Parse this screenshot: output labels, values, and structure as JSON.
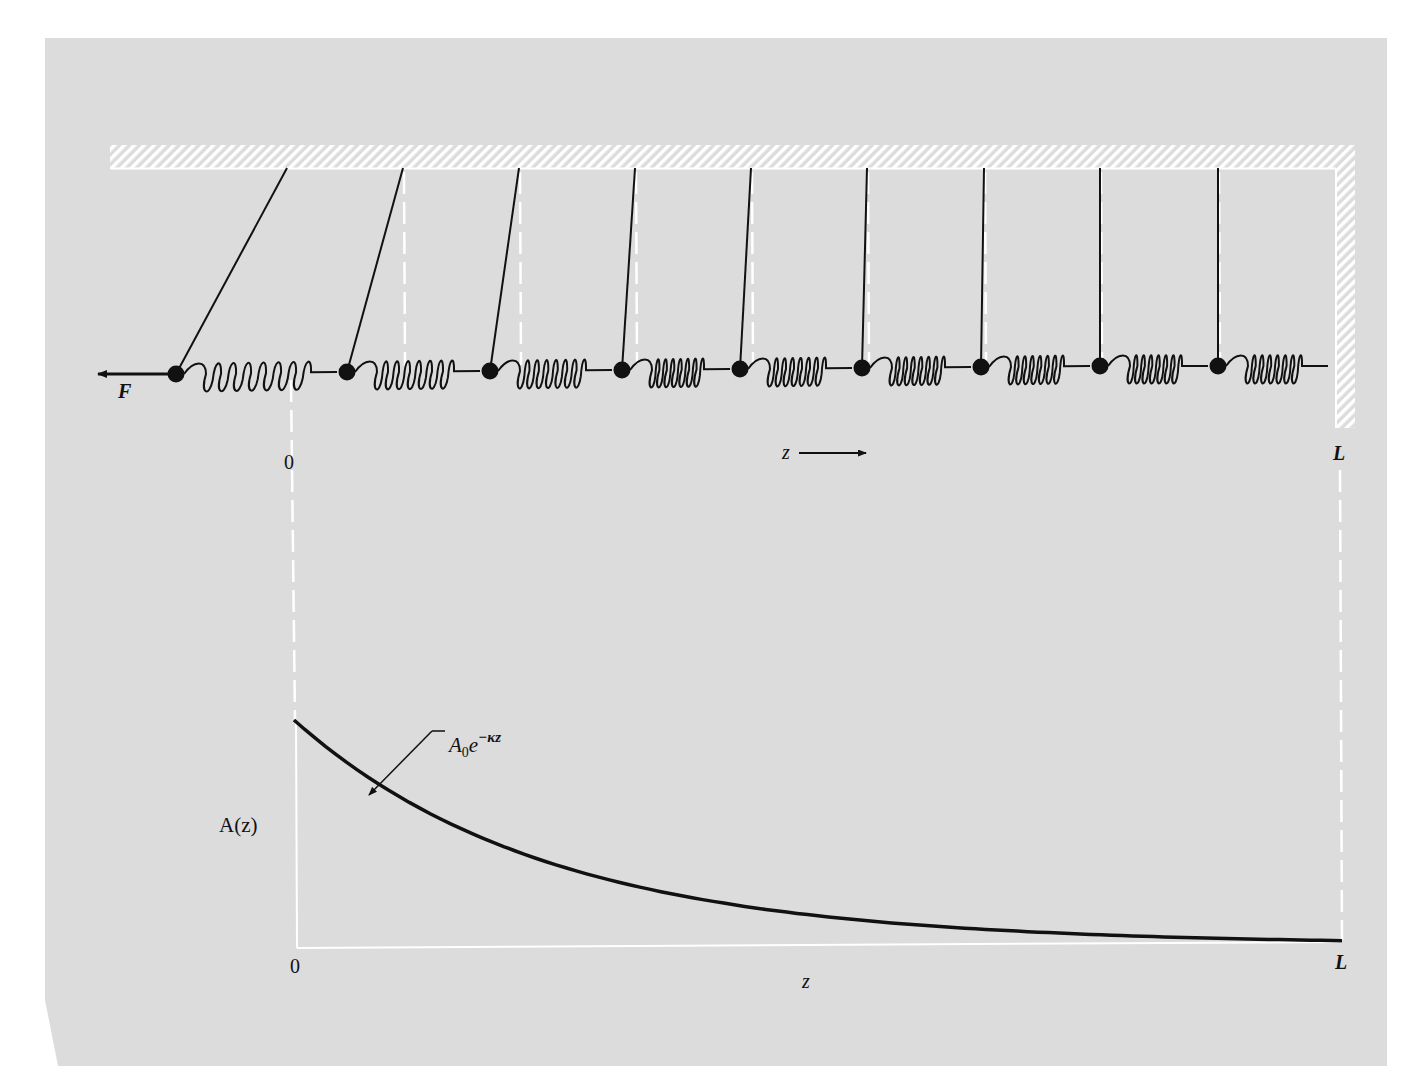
{
  "figure": {
    "background": "#ffffff",
    "panel_color": "#dcdcdc",
    "ink_color": "#111111",
    "guide_color": "#ffffff"
  },
  "top_diagram": {
    "force_label": "F",
    "origin_label": "0",
    "axis_label": "z",
    "end_label": "L",
    "mass_count": 9,
    "masses": [
      {
        "x": 176,
        "y": 374,
        "anchor_x": 287
      },
      {
        "x": 347,
        "y": 372,
        "anchor_x": 403
      },
      {
        "x": 490,
        "y": 371,
        "anchor_x": 519
      },
      {
        "x": 622,
        "y": 370,
        "anchor_x": 635
      },
      {
        "x": 740,
        "y": 369,
        "anchor_x": 751
      },
      {
        "x": 862,
        "y": 368,
        "anchor_x": 867
      },
      {
        "x": 981,
        "y": 367,
        "anchor_x": 984
      },
      {
        "x": 1100,
        "y": 366,
        "anchor_x": 1100
      },
      {
        "x": 1218,
        "y": 366,
        "anchor_x": 1218
      }
    ]
  },
  "bottom_graph": {
    "ylabel": "A(z)",
    "xlabel": "z",
    "x_origin_label": "0",
    "x_end_label": "L",
    "curve_annotation_base": "A",
    "curve_annotation_sub": "0",
    "curve_annotation_e": "e",
    "curve_annotation_exp": "−κz"
  },
  "chart_data": {
    "type": "line",
    "title": "",
    "xlabel": "z",
    "ylabel": "A(z)",
    "x_tick_labels": [
      "0",
      "L"
    ],
    "series": [
      {
        "name": "A0 e^(-κz)",
        "x": [
          0,
          0.1,
          0.2,
          0.3,
          0.4,
          0.5,
          0.6,
          0.7,
          0.8,
          0.9,
          1.0
        ],
        "values": [
          1.0,
          0.55,
          0.28,
          0.13,
          0.06,
          0.03,
          0.015,
          0.008,
          0.005,
          0.003,
          0.002
        ]
      }
    ],
    "annotations": [
      "A₀e^{−κz}"
    ],
    "grid": false,
    "legend": "none"
  }
}
